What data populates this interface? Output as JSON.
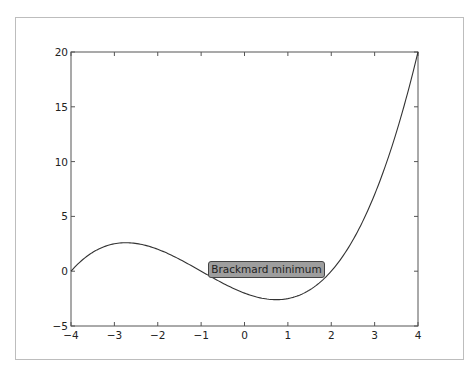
{
  "chart_data": {
    "type": "line",
    "title": "",
    "xlabel": "",
    "ylabel": "",
    "xlim": [
      -4,
      4
    ],
    "ylim": [
      -5,
      20
    ],
    "xticks": [
      "-4",
      "-3",
      "-2",
      "-1",
      "0",
      "1",
      "2",
      "3",
      "4"
    ],
    "yticks": [
      "-5",
      "0",
      "5",
      "10",
      "15",
      "20"
    ],
    "grid": false,
    "legend": null,
    "series": [
      {
        "name": "f(x)",
        "color": "#333333",
        "x": [
          -4,
          -3.5,
          -3,
          -2.7,
          -2.5,
          -2,
          -1.5,
          -1,
          -0.5,
          0,
          0.5,
          0.7,
          1,
          1.5,
          2,
          2.5,
          3,
          3.5,
          4
        ],
        "y": [
          0,
          1.97,
          2.5,
          2.6,
          2.53,
          1.0,
          -0.31,
          0,
          -1.13,
          -2.0,
          -2.53,
          -2.6,
          -2.5,
          -1.72,
          0,
          2.84,
          7.0,
          12.66,
          20.0
        ]
      }
    ],
    "annotations": [
      {
        "text": "Brackmard minimum",
        "x": 0.5,
        "y": 0.0,
        "boxcolor": "#9e9e9e"
      }
    ]
  }
}
